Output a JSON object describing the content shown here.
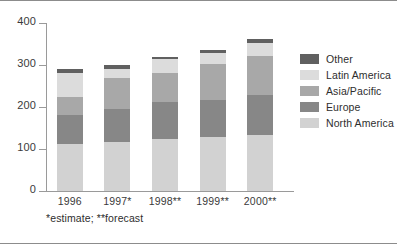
{
  "chart_data": {
    "type": "bar",
    "stacked": true,
    "title": "",
    "xlabel": "",
    "ylabel": "",
    "ylim": [
      0,
      400
    ],
    "yticks": [
      0,
      100,
      200,
      300,
      400
    ],
    "grid": false,
    "legend_position": "right",
    "categories": [
      "1996",
      "1997*",
      "1998**",
      "1999**",
      "2000**"
    ],
    "series": [
      {
        "name": "North America",
        "color": "#d2d2d2",
        "values": [
          112,
          117,
          123,
          129,
          134
        ]
      },
      {
        "name": "Europe",
        "color": "#878787",
        "values": [
          68,
          78,
          88,
          87,
          94
        ]
      },
      {
        "name": "Asia/Pacific",
        "color": "#a8a8a8",
        "values": [
          43,
          75,
          70,
          86,
          94
        ]
      },
      {
        "name": "Latin America",
        "color": "#dcdcdc",
        "values": [
          57,
          20,
          33,
          27,
          30
        ]
      },
      {
        "name": "Other",
        "color": "#606060",
        "values": [
          10,
          10,
          6,
          6,
          10
        ]
      }
    ],
    "totals": [
      290,
      300,
      320,
      335,
      362
    ],
    "legend_order": [
      "Other",
      "Latin America",
      "Asia/Pacific",
      "Europe",
      "North America"
    ],
    "annotations": [
      "*estimate;  **forecast"
    ]
  },
  "axis": {
    "ticks": [
      "400",
      "300",
      "200",
      "100",
      "0"
    ]
  },
  "legend": {
    "items": [
      {
        "label": "Other",
        "color": "#606060"
      },
      {
        "label": "Latin America",
        "color": "#dcdcdc"
      },
      {
        "label": "Asia/Pacific",
        "color": "#a8a8a8"
      },
      {
        "label": "Europe",
        "color": "#878787"
      },
      {
        "label": "North America",
        "color": "#d2d2d2"
      }
    ]
  },
  "footnote": {
    "text": "*estimate;  **forecast"
  }
}
